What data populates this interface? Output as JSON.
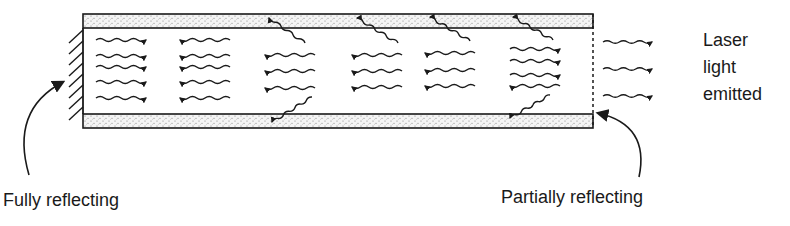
{
  "diagram": {
    "colors": {
      "ink": "#1a1a1a",
      "stipple_bg": "#f4f4f4",
      "stipple_dot": "#7a7a7a",
      "background": "#ffffff"
    },
    "tube": {
      "x_left": 83,
      "x_right": 593,
      "top_bar": {
        "y_top": 14,
        "y_bottom": 28
      },
      "bottom_bar": {
        "y_top": 114,
        "y_bottom": 128
      }
    },
    "mirrors": {
      "left": {
        "type": "fully-reflecting",
        "style": "hatched",
        "x": 83,
        "y_top": 28,
        "y_bottom": 114
      },
      "right": {
        "type": "partially-reflecting",
        "style": "dashed",
        "x": 593,
        "y_top": 14,
        "y_bottom": 128
      }
    },
    "photon_columns": [
      {
        "x_start": 96,
        "x_end": 146,
        "arrows": [
          {
            "y": 40,
            "dir": "right"
          },
          {
            "y": 56,
            "dir": "right"
          },
          {
            "y": 67,
            "dir": "right"
          },
          {
            "y": 82,
            "dir": "right"
          },
          {
            "y": 98,
            "dir": "right"
          }
        ]
      },
      {
        "x_start": 180,
        "x_end": 230,
        "arrows": [
          {
            "y": 40,
            "dir": "left"
          },
          {
            "y": 56,
            "dir": "left"
          },
          {
            "y": 67,
            "dir": "left"
          },
          {
            "y": 82,
            "dir": "left"
          },
          {
            "y": 98,
            "dir": "left"
          }
        ]
      },
      {
        "x_start": 265,
        "x_end": 315,
        "arrows": [
          {
            "y": 55,
            "dir": "left"
          },
          {
            "y": 71,
            "dir": "left"
          },
          {
            "y": 88,
            "dir": "left"
          }
        ]
      },
      {
        "x_start": 352,
        "x_end": 402,
        "arrows": [
          {
            "y": 55,
            "dir": "left"
          },
          {
            "y": 71,
            "dir": "left"
          },
          {
            "y": 87,
            "dir": "left"
          }
        ]
      },
      {
        "x_start": 425,
        "x_end": 475,
        "arrows": [
          {
            "y": 53,
            "dir": "left"
          },
          {
            "y": 70,
            "dir": "left"
          },
          {
            "y": 86,
            "dir": "left"
          }
        ]
      },
      {
        "x_start": 510,
        "x_end": 560,
        "arrows": [
          {
            "y": 49,
            "dir": "right"
          },
          {
            "y": 61,
            "dir": "right"
          },
          {
            "y": 75,
            "dir": "right"
          },
          {
            "y": 86,
            "dir": "left"
          }
        ]
      }
    ],
    "lost_photons": [
      {
        "from": [
          305,
          43
        ],
        "to": [
          269,
          18
        ]
      },
      {
        "from": [
          312,
          97
        ],
        "to": [
          272,
          122
        ]
      },
      {
        "from": [
          398,
          43
        ],
        "to": [
          357,
          18
        ]
      },
      {
        "from": [
          470,
          41
        ],
        "to": [
          430,
          17
        ]
      },
      {
        "from": [
          553,
          40
        ],
        "to": [
          513,
          17
        ]
      },
      {
        "from": [
          550,
          95
        ],
        "to": [
          510,
          118
        ]
      }
    ],
    "emitted_photons": [
      {
        "x_start": 603,
        "x_end": 652,
        "y": 42
      },
      {
        "x_start": 603,
        "x_end": 652,
        "y": 69
      },
      {
        "x_start": 603,
        "x_end": 652,
        "y": 96
      }
    ],
    "pointers": {
      "left": {
        "start": [
          29,
          175
        ],
        "ctrl": [
          10,
          110
        ],
        "end": [
          63,
          82
        ]
      },
      "right": {
        "start": [
          639,
          177
        ],
        "ctrl": [
          650,
          125
        ],
        "end": [
          598,
          113
        ]
      }
    },
    "labels": {
      "fully_reflecting": "Fully reflecting",
      "partially_reflecting": "Partially reflecting",
      "laser_output": [
        "Laser",
        "light",
        "emitted"
      ]
    }
  }
}
